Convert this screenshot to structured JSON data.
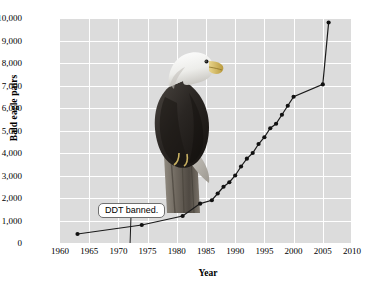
{
  "chart_data": {
    "type": "line",
    "title": "",
    "xlabel": "Year",
    "ylabel": "Bald eagle pairs",
    "xlim": [
      1960,
      2010
    ],
    "ylim": [
      0,
      10000
    ],
    "xticks": [
      "1960",
      "1965",
      "1970",
      "1975",
      "1980",
      "1985",
      "1990",
      "1995",
      "2000",
      "2005",
      "2010"
    ],
    "yticks": [
      "0",
      "1,000",
      "2,000",
      "3,000",
      "4,000",
      "5,000",
      "6,000",
      "7,000",
      "8,000",
      "9,000",
      "10,000"
    ],
    "grid": true,
    "legend": "none",
    "marker": "filled-circle",
    "x": [
      1963,
      1974,
      1981,
      1984,
      1986,
      1987,
      1988,
      1989,
      1990,
      1991,
      1992,
      1993,
      1994,
      1995,
      1996,
      1997,
      1998,
      1999,
      2000,
      2005,
      2006
    ],
    "values": [
      400,
      800,
      1200,
      1750,
      1900,
      2200,
      2500,
      2700,
      3000,
      3400,
      3750,
      4000,
      4400,
      4700,
      5100,
      5300,
      5700,
      6100,
      6500,
      7050,
      9800
    ],
    "annotations": [
      {
        "label": "DDT banned.",
        "x": 1972,
        "points_to_axis": true
      }
    ],
    "colors": {
      "plot_background": "#dcdcdc",
      "gridline": "#ffffff",
      "series_line": "#1a1a1a",
      "marker": "#111111",
      "text": "#000000",
      "callout_border": "#6f6f6f",
      "callout_background": "#ffffff"
    },
    "embedded_image": "bald-eagle-photograph"
  }
}
